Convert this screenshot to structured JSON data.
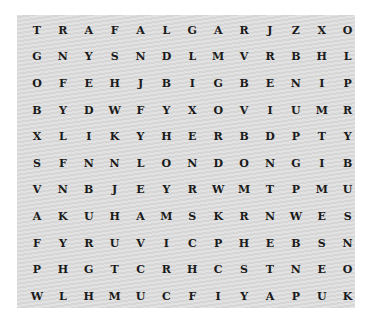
{
  "puzzle": {
    "type": "word-search",
    "rows": 11,
    "cols": 13,
    "grid": [
      [
        "T",
        "R",
        "A",
        "F",
        "A",
        "L",
        "G",
        "A",
        "R",
        "J",
        "Z",
        "X",
        "O"
      ],
      [
        "G",
        "N",
        "Y",
        "S",
        "N",
        "D",
        "L",
        "M",
        "V",
        "R",
        "B",
        "H",
        "L"
      ],
      [
        "O",
        "F",
        "E",
        "H",
        "J",
        "B",
        "I",
        "G",
        "B",
        "E",
        "N",
        "I",
        "P"
      ],
      [
        "B",
        "Y",
        "D",
        "W",
        "F",
        "Y",
        "X",
        "O",
        "V",
        "I",
        "U",
        "M",
        "R"
      ],
      [
        "X",
        "L",
        "I",
        "K",
        "Y",
        "H",
        "E",
        "R",
        "B",
        "D",
        "P",
        "T",
        "Y"
      ],
      [
        "S",
        "F",
        "N",
        "N",
        "L",
        "O",
        "N",
        "D",
        "O",
        "N",
        "G",
        "I",
        "B"
      ],
      [
        "V",
        "N",
        "B",
        "J",
        "E",
        "Y",
        "R",
        "W",
        "M",
        "T",
        "P",
        "M",
        "U"
      ],
      [
        "A",
        "K",
        "U",
        "H",
        "A",
        "M",
        "S",
        "K",
        "R",
        "N",
        "W",
        "E",
        "S"
      ],
      [
        "F",
        "Y",
        "R",
        "U",
        "V",
        "I",
        "C",
        "P",
        "H",
        "E",
        "B",
        "S",
        "N"
      ],
      [
        "P",
        "H",
        "G",
        "T",
        "C",
        "R",
        "H",
        "C",
        "S",
        "T",
        "N",
        "E",
        "O"
      ],
      [
        "W",
        "L",
        "H",
        "M",
        "U",
        "C",
        "F",
        "I",
        "Y",
        "A",
        "P",
        "U",
        "K"
      ]
    ]
  },
  "colors": {
    "background": "#ffffff",
    "board": "#dcdcdc",
    "letter": "#1a1a1a"
  }
}
